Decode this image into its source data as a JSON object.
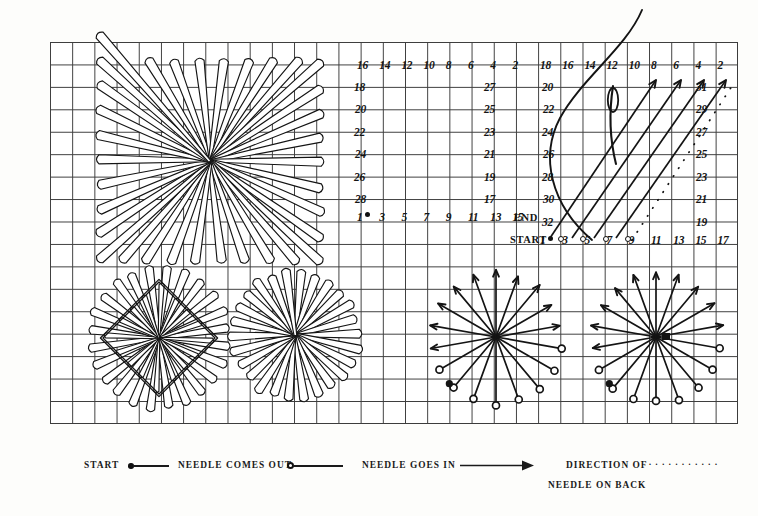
{
  "document": {
    "type": "embroidery-stitch-diagram",
    "title": "Square Eyelet / Rhodes Stitch Working Chart",
    "paper": "graph-paper",
    "ink_color": "#141414",
    "grid_color": "#3c3c3c",
    "background_color": "#ffffff"
  },
  "legend": {
    "items": [
      {
        "label": "START",
        "symbol": "filled-dot-with-line",
        "symbol_name": "start-dot"
      },
      {
        "label": "NEEDLE COMES OUT",
        "symbol": "open-circle-with-line",
        "symbol_name": "needle-out-circle"
      },
      {
        "label": "NEEDLE GOES IN",
        "symbol": "arrow",
        "symbol_name": "needle-in-arrow"
      },
      {
        "label": "DIRECTION OF",
        "label2": "NEEDLE ON BACK",
        "symbol": "dotted-line",
        "symbol_name": "back-dotted-line"
      }
    ]
  },
  "left_chart": {
    "name": "numbering-chart-front",
    "top_row": [
      "16",
      "14",
      "12",
      "10",
      "8",
      "6",
      "4",
      "2"
    ],
    "left_column": [
      "18",
      "20",
      "22",
      "24",
      "26",
      "28"
    ],
    "right_column": [
      "27",
      "25",
      "23",
      "21",
      "19",
      "17"
    ],
    "bottom_row": [
      "1",
      "3",
      "5",
      "7",
      "9",
      "11",
      "13",
      "15"
    ],
    "start_marker_number": "1",
    "end_label": "END",
    "start_label": "START",
    "end_number": "",
    "rows": 9,
    "cols": 8
  },
  "right_chart": {
    "name": "numbering-chart-with-needle",
    "top_row": [
      "18",
      "16",
      "14",
      "12",
      "10",
      "8",
      "6",
      "4",
      "2"
    ],
    "left_column": [
      "20",
      "22",
      "24",
      "26",
      "28",
      "30",
      "32"
    ],
    "right_column": [
      "31",
      "29",
      "27",
      "25",
      "23",
      "21",
      "19"
    ],
    "bottom_row": [
      "1",
      "3",
      "5",
      "7",
      "9",
      "11",
      "13",
      "15",
      "17"
    ],
    "end_label": "END",
    "end_number": "32",
    "start_label": "START",
    "needle_icon": "threaded-needle",
    "rows": 9,
    "cols": 9
  },
  "motifs": [
    {
      "name": "large-square-eyelet-star",
      "shape": "square",
      "rays": 32,
      "position": "top-left"
    },
    {
      "name": "diamond-outline-star",
      "shape": "diamond",
      "rays": 24,
      "position": "bottom-left"
    },
    {
      "name": "round-eyelet-star",
      "shape": "round",
      "rays": 24,
      "position": "bottom-center-left"
    },
    {
      "name": "working-diagram-arrows-left",
      "shape": "radial-arrows",
      "rays": 16,
      "position": "bottom-center-right"
    },
    {
      "name": "working-diagram-arrows-right",
      "shape": "radial-arrows",
      "rays": 16,
      "position": "bottom-right"
    }
  ],
  "chart_data": {
    "type": "table",
    "charts": [
      {
        "name": "left_chart",
        "top_row": [
          "16",
          "14",
          "12",
          "10",
          "8",
          "6",
          "4",
          "2"
        ],
        "left_column": [
          "18",
          "20",
          "22",
          "24",
          "26",
          "28"
        ],
        "right_column": [
          "27",
          "25",
          "23",
          "21",
          "19",
          "17"
        ],
        "bottom_row": [
          "1",
          "3",
          "5",
          "7",
          "9",
          "11",
          "13",
          "15"
        ]
      },
      {
        "name": "right_chart",
        "top_row": [
          "18",
          "16",
          "14",
          "12",
          "10",
          "8",
          "6",
          "4",
          "2"
        ],
        "left_column": [
          "20",
          "22",
          "24",
          "26",
          "28",
          "30",
          "32"
        ],
        "right_column": [
          "31",
          "29",
          "27",
          "25",
          "23",
          "21",
          "19"
        ],
        "bottom_row": [
          "1",
          "3",
          "5",
          "7",
          "9",
          "11",
          "13",
          "15",
          "17"
        ]
      }
    ]
  }
}
